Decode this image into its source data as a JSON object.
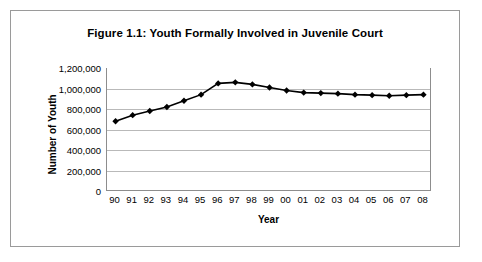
{
  "figure": {
    "title": "Figure 1.1: Youth Formally Involved in Juvenile Court"
  },
  "colors": {
    "line": "#000000",
    "marker": "#000000",
    "gridline": "#b9b9b9",
    "axis": "#8d8d8d",
    "border": "#9a9a9a",
    "background": "#ffffff"
  },
  "chart_data": {
    "type": "line",
    "title": "Figure 1.1: Youth Formally Involved in Juvenile Court",
    "xlabel": "Year",
    "ylabel": "Number of Youth",
    "categories": [
      "90",
      "91",
      "92",
      "93",
      "94",
      "95",
      "96",
      "97",
      "98",
      "99",
      "00",
      "01",
      "02",
      "03",
      "04",
      "05",
      "06",
      "07",
      "08"
    ],
    "values": [
      680000,
      740000,
      780000,
      820000,
      880000,
      940000,
      1050000,
      1060000,
      1040000,
      1010000,
      980000,
      960000,
      955000,
      950000,
      940000,
      935000,
      930000,
      935000,
      940000
    ],
    "ylim": [
      0,
      1200000
    ],
    "yticks": [
      1200000,
      1000000,
      800000,
      600000,
      400000,
      200000,
      0
    ],
    "ytick_labels": [
      "1,200,000",
      "1,000,000",
      "800,000",
      "600,000",
      "400,000",
      "200,000",
      "0"
    ],
    "grid": true,
    "legend": "none",
    "marker": "diamond"
  }
}
